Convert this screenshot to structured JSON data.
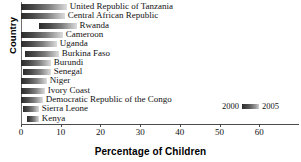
{
  "chart_data": {
    "type": "bar",
    "orientation": "horizontal",
    "title": "",
    "xlabel": "Percentage of Children",
    "ylabel": "Country",
    "xlim": [
      0,
      70
    ],
    "xticks": [
      0,
      10,
      20,
      30,
      40,
      50,
      60
    ],
    "grid": false,
    "legend_position": "bottom-right",
    "legend": [
      "2000",
      "2005"
    ],
    "note": "Each bar is drawn as a dark-to-light gradient spanning the 2000 value to the 2005 value.",
    "categories": [
      "United Republic of Tanzania",
      "Central African Republic",
      "Rwanda",
      "Cameroon",
      "Uganda",
      "Burkina Faso",
      "Burundi",
      "Senegal",
      "Niger",
      "Ivory Coast",
      "Democratic Republic of the Congo",
      "Sierra Leone",
      "Kenya"
    ],
    "values": [
      11.5,
      11.0,
      9.5,
      10.5,
      9.0,
      8.5,
      7.5,
      7.0,
      6.5,
      6.0,
      5.5,
      4.0,
      3.0
    ],
    "bar_start": [
      0.0,
      0.0,
      4.5,
      0.0,
      0.0,
      1.0,
      0.0,
      0.5,
      0.0,
      0.0,
      0.0,
      0.5,
      1.5
    ],
    "series": [
      {
        "name": "2000",
        "values": [
          11.5,
          11.0,
          14.0,
          10.5,
          9.0,
          9.5,
          7.5,
          7.5,
          6.5,
          6.0,
          5.5,
          4.5,
          4.5
        ]
      },
      {
        "name": "2005",
        "values": [
          0.0,
          0.0,
          4.5,
          0.0,
          0.0,
          1.0,
          0.0,
          0.5,
          0.0,
          0.0,
          0.0,
          0.5,
          1.5
        ]
      }
    ]
  },
  "axes": {
    "ylabel": "Country",
    "xlabel": "Percentage of Children",
    "xticks": [
      "0",
      "10",
      "20",
      "30",
      "40",
      "50",
      "60"
    ]
  },
  "legend": {
    "left_label": "2000",
    "right_label": "2005"
  },
  "colors": {
    "bar_dark": "#2b2b2b",
    "bar_light": "#dcdcdc",
    "axis": "#4a4a4a",
    "text": "#111111"
  }
}
